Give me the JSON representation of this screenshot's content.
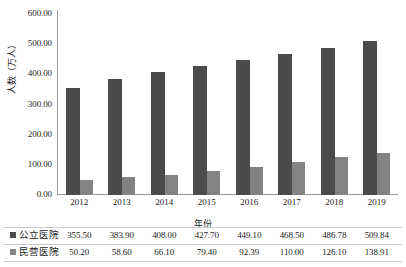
{
  "chart_data": {
    "type": "bar",
    "title": "",
    "xlabel": "年份",
    "ylabel": "人数（万人）",
    "categories": [
      "2012",
      "2013",
      "2014",
      "2015",
      "2016",
      "2017",
      "2018",
      "2019"
    ],
    "series": [
      {
        "name": "公立医院",
        "color": "#4b4b4b",
        "values": [
          355.5,
          383.9,
          408.0,
          427.7,
          449.1,
          468.5,
          486.78,
          509.84
        ],
        "labels": [
          "355.50",
          "383.90",
          "408.00",
          "427.70",
          "449.10",
          "468.50",
          "486.78",
          "509.84"
        ]
      },
      {
        "name": "民营医院",
        "color": "#838383",
        "values": [
          50.2,
          58.6,
          66.1,
          79.4,
          92.39,
          110.0,
          126.1,
          138.91
        ],
        "labels": [
          "50.20",
          "58.60",
          "66.10",
          "79.40",
          "92.39",
          "110.00",
          "126.10",
          "138.91"
        ]
      }
    ],
    "ylim": [
      0,
      600
    ],
    "yticks": [
      0,
      100,
      200,
      300,
      400,
      500,
      600
    ],
    "ytick_labels": [
      "0.00",
      "100.00",
      "200.00",
      "300.00",
      "400.00",
      "500.00",
      "600.00"
    ],
    "grid": false,
    "legend_position": "bottom-table"
  }
}
